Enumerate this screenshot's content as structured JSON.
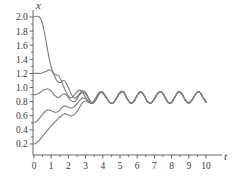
{
  "chart_data": {
    "type": "line",
    "title": "",
    "subtitle": "",
    "xlabel": "t",
    "ylabel": "x",
    "xlim": [
      -0.55,
      10.9
    ],
    "ylim": [
      0.0,
      2.12
    ],
    "grid": false,
    "legend": null,
    "legend_position": "none",
    "line_color": "#808080",
    "axis_color": "#555555",
    "background": "#ffffff",
    "xticks": [
      0,
      1,
      2,
      3,
      4,
      5,
      6,
      7,
      8,
      9,
      10
    ],
    "xticklabels": [
      "0",
      "1",
      "2",
      "3",
      "4",
      "5",
      "6",
      "7",
      "8",
      "9",
      "10"
    ],
    "xminorticks": [
      0.5,
      1.5,
      2.5,
      3.5,
      4.5,
      5.5,
      6.5,
      7.5,
      8.5,
      9.5
    ],
    "yticks": [
      0.2,
      0.4,
      0.6,
      0.8,
      1.0,
      1.2,
      1.4,
      1.6,
      1.8,
      2.0
    ],
    "yticklabels": [
      "0.2",
      "0.4",
      "0.6",
      "0.8",
      "1.0",
      "1.2",
      "1.4",
      "1.6",
      "1.8",
      "2.0"
    ],
    "yminorticks": [
      0.3,
      0.5,
      0.7,
      0.9,
      1.1,
      1.3,
      1.5,
      1.7,
      1.9
    ],
    "annotations": [],
    "series": [
      {
        "name": "x0 = 2.0",
        "initial_value": 2.0,
        "x": [
          0.0,
          0.1,
          0.2,
          0.3,
          0.4,
          0.5,
          0.6,
          0.7,
          0.8,
          0.9,
          1.0,
          1.1,
          1.2,
          1.3,
          1.4,
          1.5,
          1.6,
          1.7,
          1.8,
          1.9,
          2.0,
          2.1,
          2.2,
          2.3,
          2.4,
          2.5,
          2.6,
          2.7,
          2.8,
          2.9,
          3.0,
          3.1,
          3.2,
          3.3,
          3.4,
          3.5,
          3.6,
          3.7,
          3.8,
          3.9,
          4.0,
          4.2,
          4.4,
          4.6,
          4.8,
          5.0,
          5.2,
          5.4,
          5.6,
          5.8,
          6.0,
          6.2,
          6.4,
          6.6,
          6.8,
          7.0,
          7.2,
          7.4,
          7.6,
          7.8,
          8.0,
          8.2,
          8.4,
          8.6,
          8.8,
          9.0,
          9.2,
          9.4,
          9.6,
          9.8,
          10.0
        ],
        "y": [
          2.0,
          2.01,
          2.01,
          2.0,
          1.97,
          1.9,
          1.79,
          1.66,
          1.52,
          1.39,
          1.29,
          1.22,
          1.19,
          1.18,
          1.17,
          1.14,
          1.09,
          1.03,
          0.97,
          0.92,
          0.88,
          0.86,
          0.86,
          0.88,
          0.91,
          0.94,
          0.96,
          0.96,
          0.94,
          0.9,
          0.86,
          0.82,
          0.79,
          0.78,
          0.79,
          0.82,
          0.86,
          0.9,
          0.93,
          0.94,
          0.93,
          0.86,
          0.79,
          0.78,
          0.85,
          0.93,
          0.94,
          0.85,
          0.78,
          0.8,
          0.89,
          0.94,
          0.89,
          0.8,
          0.78,
          0.84,
          0.92,
          0.94,
          0.87,
          0.79,
          0.79,
          0.87,
          0.94,
          0.91,
          0.82,
          0.78,
          0.83,
          0.91,
          0.94,
          0.87,
          0.79
        ]
      },
      {
        "name": "x0 = 1.2",
        "initial_value": 1.2,
        "x": [
          0.0,
          0.1,
          0.2,
          0.3,
          0.4,
          0.5,
          0.6,
          0.7,
          0.8,
          0.9,
          1.0,
          1.1,
          1.2,
          1.3,
          1.4,
          1.5,
          1.6,
          1.7,
          1.8,
          1.9,
          2.0,
          2.1,
          2.2,
          2.3,
          2.4,
          2.5,
          2.6,
          2.7,
          2.8,
          2.9,
          3.0,
          3.1,
          3.2,
          3.3,
          3.4,
          3.5,
          3.6,
          3.7,
          3.8,
          3.9,
          4.0,
          4.2,
          4.4,
          4.6,
          4.8,
          5.0,
          5.2,
          5.4,
          5.6,
          5.8,
          6.0,
          6.2,
          6.4,
          6.6,
          6.8,
          7.0,
          7.2,
          7.4,
          7.6,
          7.8,
          8.0,
          8.2,
          8.4,
          8.6,
          8.8,
          9.0,
          9.2,
          9.4,
          9.6,
          9.8,
          10.0
        ],
        "y": [
          1.2,
          1.2,
          1.2,
          1.2,
          1.2,
          1.21,
          1.22,
          1.23,
          1.24,
          1.25,
          1.24,
          1.21,
          1.16,
          1.11,
          1.08,
          1.07,
          1.08,
          1.1,
          1.09,
          1.05,
          1.0,
          0.94,
          0.89,
          0.86,
          0.85,
          0.87,
          0.9,
          0.93,
          0.95,
          0.95,
          0.93,
          0.89,
          0.84,
          0.8,
          0.78,
          0.79,
          0.83,
          0.88,
          0.92,
          0.94,
          0.93,
          0.86,
          0.79,
          0.78,
          0.85,
          0.93,
          0.94,
          0.85,
          0.78,
          0.8,
          0.89,
          0.94,
          0.89,
          0.8,
          0.78,
          0.84,
          0.92,
          0.94,
          0.87,
          0.79,
          0.79,
          0.87,
          0.94,
          0.91,
          0.82,
          0.78,
          0.83,
          0.91,
          0.94,
          0.87,
          0.79
        ]
      },
      {
        "name": "x0 = 0.9",
        "initial_value": 0.9,
        "x": [
          0.0,
          0.1,
          0.2,
          0.3,
          0.4,
          0.5,
          0.6,
          0.7,
          0.8,
          0.9,
          1.0,
          1.1,
          1.2,
          1.3,
          1.4,
          1.5,
          1.6,
          1.7,
          1.8,
          1.9,
          2.0,
          2.1,
          2.2,
          2.3,
          2.4,
          2.5,
          2.6,
          2.7,
          2.8,
          2.9,
          3.0,
          3.1,
          3.2,
          3.3,
          3.4,
          3.5,
          3.6,
          3.7,
          3.8,
          3.9,
          4.0,
          4.2,
          4.4,
          4.6,
          4.8,
          5.0,
          5.2,
          5.4,
          5.6,
          5.8,
          6.0,
          6.2,
          6.4,
          6.6,
          6.8,
          7.0,
          7.2,
          7.4,
          7.6,
          7.8,
          8.0,
          8.2,
          8.4,
          8.6,
          8.8,
          9.0,
          9.2,
          9.4,
          9.6,
          9.8,
          10.0
        ],
        "y": [
          0.9,
          0.9,
          0.91,
          0.92,
          0.94,
          0.96,
          0.97,
          0.98,
          0.98,
          0.97,
          0.95,
          0.92,
          0.89,
          0.87,
          0.86,
          0.87,
          0.89,
          0.91,
          0.91,
          0.89,
          0.86,
          0.83,
          0.81,
          0.8,
          0.81,
          0.84,
          0.88,
          0.91,
          0.93,
          0.93,
          0.91,
          0.87,
          0.83,
          0.79,
          0.78,
          0.8,
          0.84,
          0.89,
          0.93,
          0.94,
          0.93,
          0.86,
          0.79,
          0.78,
          0.85,
          0.93,
          0.94,
          0.85,
          0.78,
          0.8,
          0.89,
          0.94,
          0.89,
          0.8,
          0.78,
          0.84,
          0.92,
          0.94,
          0.87,
          0.79,
          0.79,
          0.87,
          0.94,
          0.91,
          0.82,
          0.78,
          0.83,
          0.91,
          0.94,
          0.87,
          0.79
        ]
      },
      {
        "name": "x0 = 0.5",
        "initial_value": 0.5,
        "x": [
          0.0,
          0.1,
          0.2,
          0.3,
          0.4,
          0.5,
          0.6,
          0.7,
          0.8,
          0.9,
          1.0,
          1.1,
          1.2,
          1.3,
          1.4,
          1.5,
          1.6,
          1.7,
          1.8,
          1.9,
          2.0,
          2.1,
          2.2,
          2.3,
          2.4,
          2.5,
          2.6,
          2.7,
          2.8,
          2.9,
          3.0,
          3.1,
          3.2,
          3.3,
          3.4,
          3.5,
          3.6,
          3.7,
          3.8,
          3.9,
          4.0,
          4.2,
          4.4,
          4.6,
          4.8,
          5.0,
          5.2,
          5.4,
          5.6,
          5.8,
          6.0,
          6.2,
          6.4,
          6.6,
          6.8,
          7.0,
          7.2,
          7.4,
          7.6,
          7.8,
          8.0,
          8.2,
          8.4,
          8.6,
          8.8,
          9.0,
          9.2,
          9.4,
          9.6,
          9.8,
          10.0
        ],
        "y": [
          0.5,
          0.51,
          0.53,
          0.56,
          0.59,
          0.62,
          0.65,
          0.67,
          0.68,
          0.68,
          0.67,
          0.66,
          0.65,
          0.65,
          0.66,
          0.68,
          0.71,
          0.73,
          0.74,
          0.73,
          0.72,
          0.71,
          0.71,
          0.72,
          0.74,
          0.77,
          0.8,
          0.83,
          0.85,
          0.85,
          0.84,
          0.82,
          0.8,
          0.78,
          0.78,
          0.8,
          0.84,
          0.88,
          0.92,
          0.93,
          0.92,
          0.86,
          0.79,
          0.78,
          0.85,
          0.92,
          0.94,
          0.85,
          0.78,
          0.8,
          0.89,
          0.94,
          0.89,
          0.8,
          0.78,
          0.84,
          0.92,
          0.94,
          0.87,
          0.79,
          0.79,
          0.87,
          0.94,
          0.91,
          0.82,
          0.78,
          0.83,
          0.91,
          0.94,
          0.87,
          0.79
        ]
      },
      {
        "name": "x0 = 0.2",
        "initial_value": 0.2,
        "x": [
          0.0,
          0.1,
          0.2,
          0.3,
          0.4,
          0.5,
          0.6,
          0.7,
          0.8,
          0.9,
          1.0,
          1.1,
          1.2,
          1.3,
          1.4,
          1.5,
          1.6,
          1.7,
          1.8,
          1.9,
          2.0,
          2.1,
          2.2,
          2.3,
          2.4,
          2.5,
          2.6,
          2.7,
          2.8,
          2.9,
          3.0,
          3.1,
          3.2,
          3.3,
          3.4,
          3.5,
          3.6,
          3.7,
          3.8,
          3.9,
          4.0,
          4.2,
          4.4,
          4.6,
          4.8,
          5.0,
          5.2,
          5.4,
          5.6,
          5.8,
          6.0,
          6.2,
          6.4,
          6.6,
          6.8,
          7.0,
          7.2,
          7.4,
          7.6,
          7.8,
          8.0,
          8.2,
          8.4,
          8.6,
          8.8,
          9.0,
          9.2,
          9.4,
          9.6,
          9.8,
          10.0
        ],
        "y": [
          0.2,
          0.21,
          0.23,
          0.25,
          0.28,
          0.31,
          0.34,
          0.37,
          0.4,
          0.43,
          0.46,
          0.48,
          0.51,
          0.53,
          0.56,
          0.58,
          0.6,
          0.62,
          0.63,
          0.62,
          0.61,
          0.6,
          0.6,
          0.61,
          0.63,
          0.66,
          0.7,
          0.74,
          0.78,
          0.8,
          0.81,
          0.8,
          0.79,
          0.78,
          0.78,
          0.8,
          0.83,
          0.87,
          0.91,
          0.93,
          0.92,
          0.86,
          0.79,
          0.78,
          0.85,
          0.92,
          0.94,
          0.85,
          0.78,
          0.8,
          0.89,
          0.94,
          0.89,
          0.8,
          0.78,
          0.84,
          0.92,
          0.94,
          0.87,
          0.79,
          0.79,
          0.87,
          0.94,
          0.91,
          0.82,
          0.78,
          0.83,
          0.91,
          0.94,
          0.87,
          0.79
        ]
      }
    ]
  }
}
